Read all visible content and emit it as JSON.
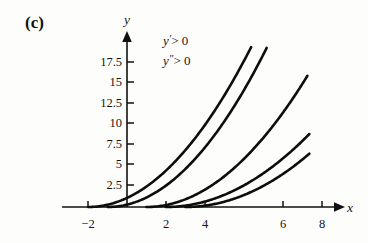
{
  "figure": {
    "panel_label": "(c)",
    "axis_x_label": "x",
    "axis_y_label": "y",
    "annotations": [
      {
        "text": "y′ > 0",
        "var": "y",
        "prime": "′",
        "rel": "> 0"
      },
      {
        "text": "y″ > 0",
        "var": "y",
        "prime": "″",
        "rel": "> 0"
      }
    ]
  },
  "chart_data": {
    "type": "line",
    "title": "(c)",
    "xlabel": "x",
    "ylabel": "y",
    "xlim": [
      -3.2,
      9.6
    ],
    "ylim": [
      -1.2,
      20.5
    ],
    "grid": false,
    "legend": null,
    "annotations": [
      "y′ > 0",
      "y″ > 0"
    ],
    "xticks": [
      -2,
      2,
      4,
      6,
      8
    ],
    "xtick_labels": [
      "−2",
      "2",
      "4",
      "6",
      "8"
    ],
    "yticks": [
      2.5,
      5,
      7.5,
      10,
      12.5,
      15,
      17.5
    ],
    "ytick_labels": [
      "2.5",
      "5",
      "7.5",
      "10",
      "12.5",
      "15",
      "17.5"
    ],
    "series": [
      {
        "name": "curve-1",
        "vertex_x": -2,
        "x": [
          -2.0,
          -1.5,
          -1.0,
          -0.5,
          0.0,
          0.5,
          1.0,
          1.5,
          2.0,
          2.5,
          3.0,
          3.5,
          4.0,
          4.5,
          5.0,
          5.5,
          6.0,
          6.4
        ],
        "y": [
          0.0,
          0.25,
          1.0,
          2.25,
          4.0,
          6.25,
          9.0,
          12.25,
          16.0,
          20.25,
          25.0,
          30.25,
          36.0,
          42.25,
          49.0,
          56.25,
          64.0,
          70.6
        ],
        "x_end": 6.4,
        "y_end": 19.5
      },
      {
        "name": "curve-2",
        "vertex_x": -1,
        "x": [
          -1.0,
          -0.5,
          0.0,
          0.5,
          1.0,
          1.5,
          2.0,
          2.5,
          3.0,
          3.5,
          4.0,
          4.5,
          5.0,
          5.5,
          6.0,
          6.5,
          7.0,
          7.2
        ],
        "y": [
          0.0,
          0.25,
          1.0,
          2.25,
          4.0,
          6.25,
          9.0,
          12.25,
          16.0,
          20.25,
          25.0,
          30.25,
          36.0,
          42.25,
          49.0,
          56.25,
          64.0,
          67.2
        ],
        "x_end": 7.2,
        "y_end": 19.4
      },
      {
        "name": "curve-3",
        "vertex_x": 1,
        "x": [
          1.0,
          1.5,
          2.0,
          2.5,
          3.0,
          3.5,
          4.0,
          4.5,
          5.0,
          5.5,
          6.0,
          6.5,
          7.0,
          7.5,
          8.0,
          8.5,
          9.0,
          9.3
        ],
        "y": [
          0.0,
          0.25,
          1.0,
          2.25,
          4.0,
          6.25,
          9.0,
          12.25,
          16.0,
          20.25,
          25.0,
          30.25,
          36.0,
          42.25,
          49.0,
          56.25,
          64.0,
          68.9
        ],
        "x_end": 9.3,
        "y_end": 16.0
      },
      {
        "name": "curve-4",
        "vertex_x": 2,
        "x": [
          2.0,
          2.5,
          3.0,
          3.5,
          4.0,
          4.5,
          5.0,
          5.5,
          6.0,
          6.5,
          7.0,
          7.5,
          8.0,
          8.5,
          9.0,
          9.4
        ],
        "y": [
          0.0,
          0.25,
          1.0,
          2.25,
          4.0,
          6.25,
          9.0,
          12.25,
          16.0,
          20.25,
          25.0,
          30.25,
          36.0,
          42.25,
          49.0,
          54.8
        ],
        "x_end": 9.4,
        "y_end": 8.9
      },
      {
        "name": "curve-5",
        "vertex_x": 3,
        "x": [
          3.0,
          3.5,
          4.0,
          4.5,
          5.0,
          5.5,
          6.0,
          6.5,
          7.0,
          7.5,
          8.0,
          8.5,
          9.0,
          9.4
        ],
        "y": [
          0.0,
          0.25,
          1.0,
          2.25,
          4.0,
          6.25,
          9.0,
          12.25,
          16.0,
          20.25,
          25.0,
          30.25,
          36.0,
          41.0
        ],
        "x_end": 9.4,
        "y_end": 6.5
      }
    ]
  }
}
